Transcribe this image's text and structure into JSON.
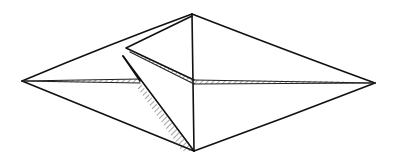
{
  "figure": {
    "title": "",
    "ink_color": "#111111",
    "background": "#ffffff"
  }
}
